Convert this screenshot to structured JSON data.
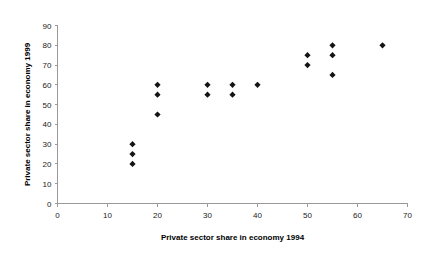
{
  "chart_data": {
    "type": "scatter",
    "title": "",
    "xlabel": "Private sector share in economy 1994",
    "ylabel": "Private sector share in economy 1999",
    "xlim": [
      0,
      70
    ],
    "ylim": [
      0,
      90
    ],
    "xticks": [
      0,
      10,
      20,
      30,
      40,
      50,
      60,
      70
    ],
    "yticks": [
      0,
      10,
      20,
      30,
      40,
      50,
      60,
      70,
      80,
      90
    ],
    "xtick_labels": [
      "0",
      "10",
      "20",
      "30",
      "40",
      "50",
      "60",
      "70"
    ],
    "ytick_labels": [
      "0",
      "10",
      "20",
      "30",
      "40",
      "50",
      "60",
      "70",
      "80",
      "90"
    ],
    "grid": false,
    "legend": false,
    "marker_shape": "diamond",
    "marker_color": "#141414",
    "series": [
      {
        "name": "countries",
        "points": [
          {
            "x": 15,
            "y": 30
          },
          {
            "x": 15,
            "y": 25
          },
          {
            "x": 15,
            "y": 20
          },
          {
            "x": 20,
            "y": 60
          },
          {
            "x": 20,
            "y": 55
          },
          {
            "x": 20,
            "y": 45
          },
          {
            "x": 30,
            "y": 60
          },
          {
            "x": 30,
            "y": 55
          },
          {
            "x": 35,
            "y": 60
          },
          {
            "x": 35,
            "y": 55
          },
          {
            "x": 40,
            "y": 60
          },
          {
            "x": 50,
            "y": 75
          },
          {
            "x": 50,
            "y": 70
          },
          {
            "x": 55,
            "y": 80
          },
          {
            "x": 55,
            "y": 75
          },
          {
            "x": 55,
            "y": 65
          },
          {
            "x": 65,
            "y": 80
          }
        ]
      }
    ]
  }
}
